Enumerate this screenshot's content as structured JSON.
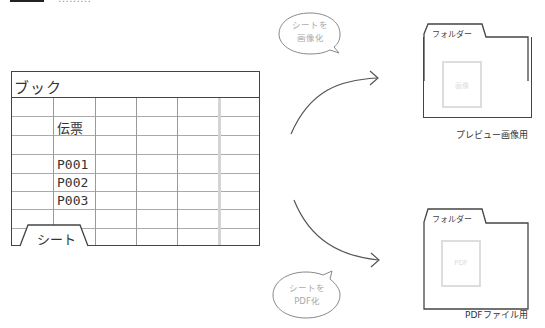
{
  "header": {
    "partial_text": "………"
  },
  "book": {
    "title": "ブック",
    "rows": [
      [
        "",
        "",
        "",
        "",
        "",
        ""
      ],
      [
        "",
        "伝票",
        "",
        "",
        "",
        ""
      ],
      [
        "",
        "",
        "",
        "",
        "",
        ""
      ],
      [
        "",
        "P001",
        "",
        "",
        "",
        ""
      ],
      [
        "",
        "P002",
        "",
        "",
        "",
        ""
      ],
      [
        "",
        "P003",
        "",
        "",
        "",
        ""
      ],
      [
        "",
        "",
        "",
        "",
        "",
        ""
      ],
      [
        "",
        "",
        "",
        "",
        "",
        ""
      ]
    ],
    "cells": {
      "header": "伝票",
      "r1": "P001",
      "r2": "P002",
      "r3": "P003"
    },
    "sheet_tab": "シート"
  },
  "bubbles": {
    "image": {
      "line1": "シートを",
      "line2": "画像化"
    },
    "pdf": {
      "line1": "シートを",
      "line2": "PDF化"
    }
  },
  "folders": {
    "preview": {
      "tab_label": "フォルダー",
      "thumb_label": "画像",
      "caption": "プレビュー画像用"
    },
    "pdf": {
      "tab_label": "フォルダー",
      "thumb_label": "PDF",
      "caption": "PDFファイル用"
    }
  },
  "colors": {
    "line": "#444444",
    "grid": "#aaaaaa",
    "faint": "#dddddd"
  }
}
